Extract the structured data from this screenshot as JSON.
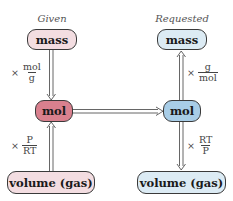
{
  "diagram": {
    "headers": {
      "given": "Given",
      "requested": "Requested"
    },
    "given_column": {
      "mass": "mass",
      "mol": "mol",
      "volume": "volume (gas)",
      "factor_mass_to_mol": {
        "prefix": "×",
        "numerator": "mol",
        "denominator": "g"
      },
      "factor_volume_to_mol": {
        "prefix": "×",
        "numerator": "P",
        "denominator": "RT"
      }
    },
    "requested_column": {
      "mass": "mass",
      "mol": "mol",
      "volume": "volume (gas)",
      "factor_mol_to_mass": {
        "prefix": "×",
        "numerator": "g",
        "denominator": "mol"
      },
      "factor_mol_to_volume": {
        "prefix": "×",
        "numerator": "RT",
        "denominator": "P"
      }
    },
    "colors": {
      "given_light": "#f3dde1",
      "given_dark": "#d9808e",
      "requested_light": "#dcebf4",
      "requested_dark": "#a8cde7",
      "arrow": "#555555"
    }
  }
}
